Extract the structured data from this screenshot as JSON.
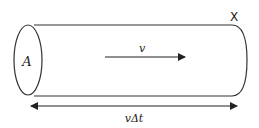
{
  "diagram": {
    "area_label": "A",
    "velocity_label": "v",
    "length_label": "vΔt",
    "end_label": "X",
    "stroke_color": "#333333"
  }
}
